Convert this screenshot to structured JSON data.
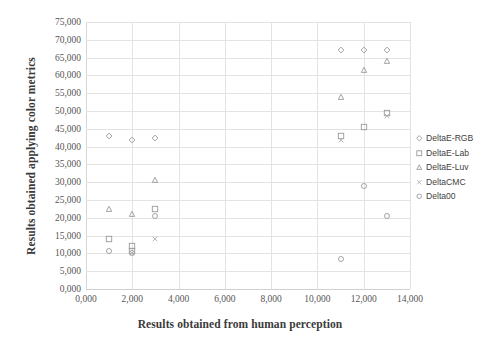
{
  "chart_data": {
    "type": "scatter",
    "title": "",
    "xlabel": "Results obtained from human perception",
    "ylabel": "Results obtained applying color metrics",
    "xlim": [
      0,
      14000
    ],
    "ylim": [
      0,
      75000
    ],
    "x_ticks": [
      "0,000",
      "2,000",
      "4,000",
      "6,000",
      "8,000",
      "10,000",
      "12,000",
      "14,000"
    ],
    "x_tick_values": [
      0,
      2000,
      4000,
      6000,
      8000,
      10000,
      12000,
      14000
    ],
    "y_ticks": [
      "0,000",
      "5,000",
      "10,000",
      "15,000",
      "20,000",
      "25,000",
      "30,000",
      "35,000",
      "40,000",
      "45,000",
      "50,000",
      "55,000",
      "60,000",
      "65,000",
      "70,000",
      "75,000"
    ],
    "y_tick_values": [
      0,
      5000,
      10000,
      15000,
      20000,
      25000,
      30000,
      35000,
      40000,
      45000,
      50000,
      55000,
      60000,
      65000,
      70000,
      75000
    ],
    "grid": true,
    "legend_position": "right",
    "series": [
      {
        "name": "DeltaE-RGB",
        "marker": "diamond",
        "color": "#9a9a9a",
        "points": [
          {
            "x": 1000,
            "y": 43000
          },
          {
            "x": 2000,
            "y": 41800
          },
          {
            "x": 3000,
            "y": 42500
          },
          {
            "x": 11000,
            "y": 67000
          },
          {
            "x": 12000,
            "y": 67000
          },
          {
            "x": 13000,
            "y": 67000
          }
        ]
      },
      {
        "name": "DeltaE-Lab",
        "marker": "square",
        "color": "#9a9a9a",
        "points": [
          {
            "x": 1000,
            "y": 14000
          },
          {
            "x": 2000,
            "y": 12000
          },
          {
            "x": 2000,
            "y": 10800
          },
          {
            "x": 3000,
            "y": 22500
          },
          {
            "x": 11000,
            "y": 43000
          },
          {
            "x": 12000,
            "y": 45500
          },
          {
            "x": 13000,
            "y": 49500
          }
        ]
      },
      {
        "name": "DeltaE-Luv",
        "marker": "triangle",
        "color": "#9a9a9a",
        "points": [
          {
            "x": 1000,
            "y": 22500
          },
          {
            "x": 2000,
            "y": 21000
          },
          {
            "x": 3000,
            "y": 30500
          },
          {
            "x": 11000,
            "y": 54000
          },
          {
            "x": 12000,
            "y": 61500
          },
          {
            "x": 13000,
            "y": 64000
          }
        ]
      },
      {
        "name": "DeltaCMC",
        "marker": "cross",
        "color": "#b0b0b0",
        "points": [
          {
            "x": 2000,
            "y": 10000
          },
          {
            "x": 3000,
            "y": 14000
          },
          {
            "x": 11000,
            "y": 41800
          },
          {
            "x": 13000,
            "y": 48500
          }
        ]
      },
      {
        "name": "Delta00",
        "marker": "circle",
        "color": "#9a9a9a",
        "points": [
          {
            "x": 1000,
            "y": 10800
          },
          {
            "x": 2000,
            "y": 10000
          },
          {
            "x": 3000,
            "y": 20500
          },
          {
            "x": 12000,
            "y": 29000
          },
          {
            "x": 13000,
            "y": 20500
          },
          {
            "x": 11000,
            "y": 8500
          }
        ]
      }
    ]
  },
  "legend": {
    "entries": [
      {
        "label": "DeltaE-RGB",
        "marker": "diamond"
      },
      {
        "label": "DeltaE-Lab",
        "marker": "square"
      },
      {
        "label": "DeltaE-Luv",
        "marker": "triangle"
      },
      {
        "label": "DeltaCMC",
        "marker": "cross"
      },
      {
        "label": "Delta00",
        "marker": "circle"
      }
    ]
  },
  "colors": {
    "marker": "#9a9a9a",
    "grid": "#e3e3e3",
    "text": "#4a4a4a"
  }
}
